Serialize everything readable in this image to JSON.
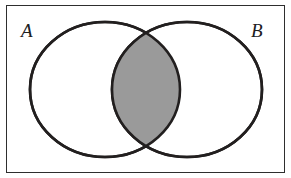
{
  "figure": {
    "caption": "",
    "background_color": "#ffffff"
  },
  "frame": {
    "visible": true,
    "border_color": "#2e2e2e",
    "border_width_px": 1,
    "fill_color": "#ffffff"
  },
  "labels": {
    "set_a": "A",
    "set_b": "B"
  },
  "style": {
    "circle_stroke_color": "#221f1f",
    "circle_stroke_width_px": 2.6,
    "circle_fill_color": "#ffffff",
    "intersection_fill_color": "#9a9a9a",
    "label_color": "#20201f"
  },
  "chart_data": {
    "type": "diagram",
    "diagram_type": "venn",
    "sets": [
      {
        "name": "A",
        "label": "A",
        "shape": "ellipse",
        "cx": 105,
        "cy": 89.5,
        "rx": 75,
        "ry": 67.5,
        "fill": "#ffffff",
        "stroke": "#221f1f",
        "label_position": "top-left"
      },
      {
        "name": "B",
        "label": "B",
        "shape": "ellipse",
        "cx": 187,
        "cy": 89.5,
        "rx": 75,
        "ry": 67.5,
        "fill": "#ffffff",
        "stroke": "#221f1f",
        "label_position": "top-right"
      }
    ],
    "regions": [
      {
        "id": "A_only",
        "expression": "A \\ B",
        "shaded": false,
        "fill": "#ffffff"
      },
      {
        "id": "A_and_B",
        "expression": "A ∩ B",
        "shaded": true,
        "fill": "#9a9a9a"
      },
      {
        "id": "B_only",
        "expression": "B \\ A",
        "shaded": false,
        "fill": "#ffffff"
      },
      {
        "id": "outside",
        "expression": "(A ∪ B)'",
        "shaded": false,
        "fill": "#ffffff"
      }
    ],
    "intersection": {
      "shaded": true,
      "fill": "#9a9a9a",
      "top_crossing": {
        "x": 146,
        "y": 34
      },
      "bottom_crossing": {
        "x": 146,
        "y": 145
      },
      "left_extent_x": 112,
      "right_extent_x": 180
    },
    "legend": null,
    "grid": false,
    "xlabel": "",
    "ylabel": ""
  }
}
